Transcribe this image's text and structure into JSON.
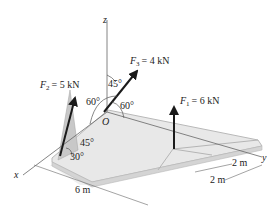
{
  "diagram": {
    "axes": {
      "x": "x",
      "y": "y",
      "z": "z",
      "origin": "O"
    },
    "forces": [
      {
        "name": "F",
        "sub": "1",
        "value": "= 6 kN"
      },
      {
        "name": "F",
        "sub": "2",
        "value": "= 5 kN"
      },
      {
        "name": "F",
        "sub": "3",
        "value": "= 4 kN"
      }
    ],
    "angles": {
      "f3_z": "45°",
      "f3_x": "60°",
      "f3_y": "60°",
      "f2_vert": "45°",
      "f2_horiz": "30°"
    },
    "dimensions": {
      "length_x": "6 m",
      "width_y1": "2 m",
      "width_y2": "2 m"
    },
    "colors": {
      "plate": "#e6e6e6",
      "plate_edge": "#b9b9b9",
      "shadow": "#cfcfcf",
      "arrow": "#1a1a1a",
      "axis": "#555555"
    }
  }
}
